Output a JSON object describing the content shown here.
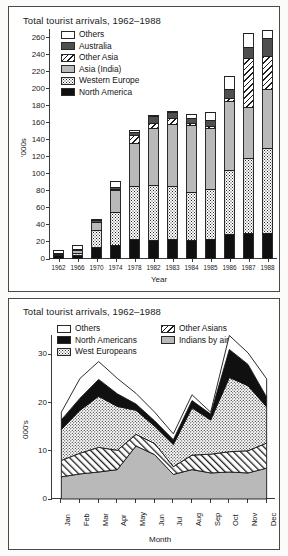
{
  "page": {
    "background": "#fbfbfa"
  },
  "colors": {
    "others": "#ffffff",
    "australia": "#4f4f4f",
    "other_asia": "#ffffff",
    "asia_india": "#b9b9b9",
    "western_europe": "#ffffff",
    "north_america": "#101010",
    "axis": "#3a3a3a",
    "text": "#1b1b1b"
  },
  "top_chart": {
    "title": "Total tourist arrivals, 1962–1988",
    "ylabel": "'000s",
    "xlabel": "Year",
    "legend": [
      {
        "label": "Others",
        "key": "white"
      },
      {
        "label": "Australia",
        "key": "dark-grey"
      },
      {
        "label": "Other Asia",
        "key": "hatch"
      },
      {
        "label": "Asia (India)",
        "key": "light-grey"
      },
      {
        "label": "Western Europe",
        "key": "dots"
      },
      {
        "label": "North America",
        "key": "black"
      }
    ],
    "ytick_labels": [
      "0",
      "20",
      "40",
      "60",
      "80",
      "100",
      "120",
      "140",
      "160",
      "180",
      "200",
      "220",
      "240",
      "260"
    ],
    "xtick_labels": [
      "1962",
      "1966",
      "1970",
      "1974",
      "1978",
      "1982",
      "1983",
      "1984",
      "1985",
      "1986",
      "1987",
      "1988"
    ]
  },
  "bottom_chart": {
    "title": "Total tourist arrivals, 1962–1988",
    "ylabel": "000's",
    "xlabel": "Month",
    "legend_col1": [
      {
        "label": "Others",
        "key": "white"
      },
      {
        "label": "North Americans",
        "key": "black"
      },
      {
        "label": "West Europeans",
        "key": "dots"
      }
    ],
    "legend_col2": [
      {
        "label": "Other Asians",
        "key": "hatch"
      },
      {
        "label": "Indians by air",
        "key": "light-grey"
      }
    ],
    "ytick_labels": [
      "0",
      "10",
      "20",
      "30"
    ],
    "xtick_labels": [
      "Jan",
      "Feb",
      "Mar",
      "Apr",
      "May",
      "Jun",
      "Jul",
      "Aug",
      "Sep",
      "Oct",
      "Nov",
      "Dec"
    ]
  },
  "chart_data": [
    {
      "type": "bar",
      "stacked": true,
      "title": "Total tourist arrivals, 1962–1988",
      "xlabel": "Year",
      "ylabel": "'000s",
      "ylim": [
        0,
        270
      ],
      "yticks": [
        0,
        20,
        40,
        60,
        80,
        100,
        120,
        140,
        160,
        180,
        200,
        220,
        240,
        260
      ],
      "grid": false,
      "legend_position": "upper-left-inside",
      "categories": [
        "1962",
        "1966",
        "1970",
        "1974",
        "1978",
        "1982",
        "1983",
        "1984",
        "1985",
        "1986",
        "1987",
        "1988"
      ],
      "series": [
        {
          "name": "North America",
          "fill": "black",
          "values": [
            5,
            5,
            14,
            17,
            24,
            22,
            23,
            22,
            23,
            29,
            31,
            31
          ]
        },
        {
          "name": "Western Europe",
          "fill": "dots",
          "values": [
            1,
            2,
            20,
            38,
            62,
            65,
            63,
            57,
            59,
            76,
            88,
            99
          ]
        },
        {
          "name": "Asia (India)",
          "fill": "light-grey",
          "values": [
            1,
            3,
            9,
            26,
            50,
            67,
            72,
            78,
            72,
            81,
            59,
            70
          ]
        },
        {
          "name": "Other Asia",
          "fill": "hatch",
          "values": [
            0,
            1,
            1,
            1,
            9,
            6,
            8,
            3,
            2,
            3,
            58,
            38
          ]
        },
        {
          "name": "Australia",
          "fill": "dark-grey",
          "values": [
            0,
            1,
            2,
            3,
            4,
            8,
            6,
            5,
            7,
            11,
            13,
            21
          ]
        },
        {
          "name": "Others",
          "fill": "white",
          "values": [
            3,
            4,
            1,
            6,
            2,
            1,
            2,
            5,
            10,
            15,
            16,
            10
          ]
        }
      ],
      "totals": [
        10,
        16,
        47,
        91,
        151,
        169,
        174,
        170,
        173,
        215,
        265,
        269
      ]
    },
    {
      "type": "area",
      "stacked": true,
      "title": "Total tourist arrivals, 1962–1988",
      "xlabel": "Month",
      "ylabel": "000's",
      "ylim": [
        0,
        34
      ],
      "yticks": [
        0,
        10,
        20,
        30
      ],
      "grid": false,
      "legend_position": "upper-left-inside",
      "categories": [
        "Jan",
        "Feb",
        "Mar",
        "Apr",
        "May",
        "Jun",
        "Jul",
        "Aug",
        "Sep",
        "Oct",
        "Nov",
        "Dec"
      ],
      "series": [
        {
          "name": "Indians by air",
          "fill": "light-grey",
          "values": [
            4.6,
            5.2,
            5.6,
            6.1,
            11.0,
            9.2,
            5.1,
            6.1,
            5.4,
            5.6,
            5.4,
            6.4
          ]
        },
        {
          "name": "Other Asians",
          "fill": "hatch",
          "values": [
            3.4,
            4.3,
            5.1,
            4.0,
            2.4,
            2.3,
            1.6,
            3.0,
            3.9,
            4.2,
            4.6,
            5.2
          ]
        },
        {
          "name": "West Europeans",
          "fill": "dots",
          "values": [
            6.4,
            8.9,
            10.6,
            9.1,
            5.0,
            3.6,
            4.6,
            9.8,
            7.1,
            15.4,
            13.5,
            7.5
          ]
        },
        {
          "name": "North Americans",
          "fill": "black",
          "values": [
            2.0,
            2.5,
            3.5,
            2.6,
            1.3,
            1.1,
            1.0,
            1.5,
            1.2,
            5.8,
            4.4,
            2.0
          ]
        },
        {
          "name": "Others",
          "fill": "white",
          "values": [
            1.6,
            4.1,
            3.7,
            3.2,
            2.2,
            1.8,
            1.2,
            1.2,
            0.4,
            2.9,
            2.4,
            3.8
          ]
        }
      ],
      "totals": [
        18.0,
        25.0,
        28.5,
        25.0,
        21.9,
        18.0,
        13.5,
        21.6,
        18.0,
        33.9,
        30.3,
        24.9
      ]
    }
  ]
}
